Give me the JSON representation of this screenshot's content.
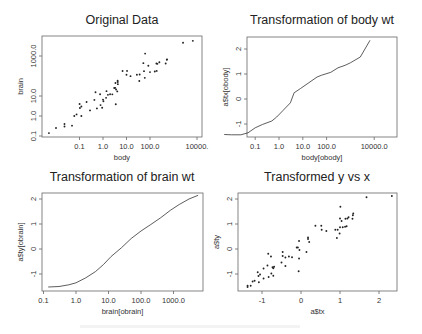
{
  "chart_data": [
    {
      "type": "scatter",
      "title": "Original Data",
      "xlabel": "body",
      "ylabel": "brain",
      "xscale": "log",
      "yscale": "log",
      "xticks": [
        "0.1",
        "1.0",
        "10.0",
        "100.0",
        "10000."
      ],
      "xtick_values": [
        0.1,
        1,
        10,
        100,
        10000
      ],
      "yticks": [
        "0.1",
        "1.0",
        "10.0",
        "1000.0"
      ],
      "ytick_values": [
        0.1,
        1,
        10,
        1000
      ],
      "grid": false,
      "points": [
        [
          0.005,
          0.14
        ],
        [
          0.01,
          0.25
        ],
        [
          0.023,
          0.3
        ],
        [
          0.023,
          0.4
        ],
        [
          0.048,
          0.33
        ],
        [
          0.075,
          1.2
        ],
        [
          0.06,
          1.0
        ],
        [
          0.101,
          4.0
        ],
        [
          0.104,
          2.5
        ],
        [
          0.12,
          3.0
        ],
        [
          0.12,
          1.0
        ],
        [
          0.2,
          5.0
        ],
        [
          0.28,
          1.9
        ],
        [
          0.43,
          6.4
        ],
        [
          0.48,
          15.5
        ],
        [
          0.55,
          2.4
        ],
        [
          0.75,
          12.3
        ],
        [
          0.785,
          3.5
        ],
        [
          0.92,
          2.6
        ],
        [
          1.0,
          6.6
        ],
        [
          1.04,
          5.5
        ],
        [
          1.35,
          8.1
        ],
        [
          1.41,
          17.5
        ],
        [
          1.62,
          11.4
        ],
        [
          2.0,
          12.3
        ],
        [
          2.5,
          12.1
        ],
        [
          3.0,
          25.0
        ],
        [
          3.3,
          25.6
        ],
        [
          3.385,
          44.5
        ],
        [
          3.5,
          3.9
        ],
        [
          3.6,
          21.0
        ],
        [
          4.05,
          17.0
        ],
        [
          4.19,
          58.0
        ],
        [
          4.235,
          50.4
        ],
        [
          4.288,
          39.2
        ],
        [
          6.8,
          179.0
        ],
        [
          10.55,
          179.5
        ],
        [
          10.0,
          115.0
        ],
        [
          14.83,
          98.2
        ],
        [
          27.66,
          115.0
        ],
        [
          35.0,
          56.0
        ],
        [
          36.33,
          119.5
        ],
        [
          52.16,
          440.0
        ],
        [
          55.5,
          175.0
        ],
        [
          60.0,
          81.0
        ],
        [
          62.0,
          1320.0
        ],
        [
          85.0,
          325.0
        ],
        [
          100.0,
          157.0
        ],
        [
          160.0,
          169.0
        ],
        [
          187.1,
          419.0
        ],
        [
          192.0,
          180.0
        ],
        [
          207.0,
          406.0
        ],
        [
          250.0,
          490.0
        ],
        [
          465.0,
          423.0
        ],
        [
          521.0,
          655.0
        ],
        [
          529.0,
          680.0
        ],
        [
          2547.0,
          4603.0
        ],
        [
          6654.0,
          5712.0
        ]
      ]
    },
    {
      "type": "line",
      "title": "Transformation of body wt",
      "xlabel": "body[obody]",
      "ylabel": "a$tx[obody]",
      "xscale": "log",
      "xticks": [
        "0.1",
        "1.0",
        "10.0",
        "100.0",
        "10000.0"
      ],
      "xtick_values": [
        0.1,
        1,
        10,
        100,
        10000
      ],
      "yticks": [
        "-1",
        "0",
        "1",
        "2"
      ],
      "ytick_values": [
        -1,
        0,
        1,
        2
      ],
      "grid": false,
      "points": [
        [
          0.005,
          -1.42
        ],
        [
          0.01,
          -1.43
        ],
        [
          0.025,
          -1.43
        ],
        [
          0.05,
          -1.35
        ],
        [
          0.1,
          -1.15
        ],
        [
          0.2,
          -1.02
        ],
        [
          0.5,
          -0.88
        ],
        [
          0.8,
          -0.72
        ],
        [
          1.5,
          -0.45
        ],
        [
          3.0,
          -0.15
        ],
        [
          4.3,
          0.25
        ],
        [
          8.0,
          0.42
        ],
        [
          15.0,
          0.6
        ],
        [
          40.0,
          0.88
        ],
        [
          60.0,
          0.95
        ],
        [
          150.0,
          1.07
        ],
        [
          300.0,
          1.25
        ],
        [
          600.0,
          1.35
        ],
        [
          1000.0,
          1.45
        ],
        [
          2600.0,
          1.68
        ],
        [
          6654.0,
          2.35
        ]
      ]
    },
    {
      "type": "line",
      "title": "Transformation of brain wt",
      "xlabel": "brain[obrain]",
      "ylabel": "a$ty[obrain]",
      "xscale": "log",
      "xticks": [
        "0.1",
        "1.0",
        "10.0",
        "100.0",
        "1000.0"
      ],
      "xtick_values": [
        0.1,
        1,
        10,
        100,
        1000
      ],
      "yticks": [
        "-1",
        "0",
        "1",
        "2"
      ],
      "ytick_values": [
        -1,
        0,
        1,
        2
      ],
      "grid": false,
      "points": [
        [
          0.14,
          -1.52
        ],
        [
          0.3,
          -1.5
        ],
        [
          0.6,
          -1.43
        ],
        [
          1.0,
          -1.35
        ],
        [
          2.0,
          -1.15
        ],
        [
          4.0,
          -0.9
        ],
        [
          7.0,
          -0.62
        ],
        [
          12.0,
          -0.3
        ],
        [
          25.0,
          0.05
        ],
        [
          50.0,
          0.42
        ],
        [
          100.0,
          0.72
        ],
        [
          200.0,
          0.98
        ],
        [
          400.0,
          1.25
        ],
        [
          800.0,
          1.55
        ],
        [
          1500.0,
          1.78
        ],
        [
          3000.0,
          2.0
        ],
        [
          5712.0,
          2.15
        ]
      ]
    },
    {
      "type": "scatter",
      "title": "Transformed y vs x",
      "xlabel": "a$tx",
      "ylabel": "a$ty",
      "xticks": [
        "-1",
        "0",
        "1",
        "2"
      ],
      "xtick_values": [
        -1,
        0,
        1,
        2
      ],
      "yticks": [
        "-1",
        "0",
        "1",
        "2"
      ],
      "ytick_values": [
        -1,
        0,
        1,
        2
      ],
      "grid": false,
      "points": [
        [
          2.33,
          2.12
        ],
        [
          1.68,
          2.07
        ],
        [
          1.01,
          1.69
        ],
        [
          1.34,
          1.42
        ],
        [
          1.33,
          1.35
        ],
        [
          1.22,
          1.27
        ],
        [
          1.19,
          1.22
        ],
        [
          1.32,
          1.21
        ],
        [
          1.14,
          1.21
        ],
        [
          1.0,
          1.22
        ],
        [
          1.04,
          1.12
        ],
        [
          0.37,
          0.93
        ],
        [
          0.52,
          0.93
        ],
        [
          0.53,
          0.77
        ],
        [
          0.65,
          0.72
        ],
        [
          0.88,
          0.77
        ],
        [
          0.94,
          0.77
        ],
        [
          1.0,
          0.87
        ],
        [
          1.07,
          0.87
        ],
        [
          1.13,
          0.89
        ],
        [
          1.17,
          0.91
        ],
        [
          0.99,
          0.62
        ],
        [
          0.92,
          0.44
        ],
        [
          0.18,
          0.46
        ],
        [
          0.18,
          0.4
        ],
        [
          0.21,
          0.28
        ],
        [
          -0.05,
          0.32
        ],
        [
          -0.08,
          0.06
        ],
        [
          -0.11,
          0.06
        ],
        [
          0.14,
          -0.12
        ],
        [
          -0.04,
          -0.04
        ],
        [
          -0.47,
          -0.12
        ],
        [
          -0.84,
          -0.19
        ],
        [
          -0.77,
          -0.3
        ],
        [
          -0.47,
          -0.28
        ],
        [
          -0.4,
          -0.34
        ],
        [
          -0.31,
          -0.3
        ],
        [
          -0.23,
          -0.33
        ],
        [
          -0.05,
          -0.38
        ],
        [
          -0.5,
          -0.54
        ],
        [
          -0.4,
          -0.68
        ],
        [
          -0.86,
          -0.66
        ],
        [
          -0.69,
          -0.71
        ],
        [
          -0.71,
          -0.77
        ],
        [
          -0.73,
          -0.73
        ],
        [
          -0.96,
          -0.78
        ],
        [
          -0.06,
          -0.89
        ],
        [
          -0.76,
          -0.98
        ],
        [
          -1.11,
          -0.93
        ],
        [
          -1.05,
          -1.02
        ],
        [
          -0.71,
          -1.07
        ],
        [
          -1.09,
          -1.08
        ],
        [
          -0.83,
          -1.12
        ],
        [
          -0.96,
          -1.18
        ],
        [
          -1.24,
          -1.3
        ],
        [
          -1.19,
          -1.27
        ],
        [
          -1.08,
          -1.33
        ],
        [
          -1.37,
          -1.47
        ],
        [
          -1.37,
          -1.52
        ],
        [
          -1.29,
          -1.47
        ]
      ]
    }
  ],
  "layout": {
    "panels": [
      {
        "frame": [
          42,
          36,
          202,
          137
        ],
        "title_y": 24,
        "xmap": {
          "type": "log",
          "px0": 103,
          "pxPerUnit": 23.5
        },
        "ymap": {
          "type": "log",
          "px0": 116,
          "pxPerUnit": 20
        }
      },
      {
        "frame": [
          247,
          37,
          397,
          137
        ],
        "title_y": 24,
        "xmap": {
          "type": "log",
          "px0": 279,
          "pxPerUnit": 23.8
        },
        "ymap": {
          "type": "lin",
          "px0": 99,
          "pxPerUnit": 25
        }
      },
      {
        "frame": [
          42,
          193,
          203,
          291
        ],
        "title_y": 181,
        "xmap": {
          "type": "log",
          "px0": 76,
          "pxPerUnit": 32.5
        },
        "ymap": {
          "type": "lin",
          "px0": 249,
          "pxPerUnit": 25
        }
      },
      {
        "frame": [
          238,
          193,
          397,
          291
        ],
        "title_y": 181,
        "xmap": {
          "type": "lin",
          "px0": 301,
          "pxPerUnit": 39
        },
        "ymap": {
          "type": "lin",
          "px0": 249,
          "pxPerUnit": 25
        }
      }
    ]
  }
}
